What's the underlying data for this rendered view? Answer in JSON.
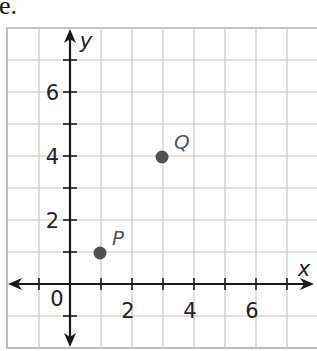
{
  "cropped_text": "e.",
  "chart_data": {
    "type": "scatter",
    "title": "",
    "xlabel": "x",
    "ylabel": "y",
    "xlim": [
      -2,
      8
    ],
    "ylim": [
      -2,
      8
    ],
    "grid": true,
    "x_tick_labels": [
      "0",
      "2",
      "4",
      "6"
    ],
    "y_tick_labels": [
      "2",
      "4",
      "6"
    ],
    "points": [
      {
        "label": "P",
        "x": 1,
        "y": 1
      },
      {
        "label": "Q",
        "x": 3,
        "y": 4
      }
    ]
  },
  "colors": {
    "grid": "#c8c8c8",
    "axis": "#1a1a1a",
    "point": "#505050",
    "point_label": "#555555"
  }
}
